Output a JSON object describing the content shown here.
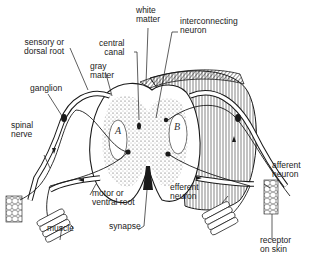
{
  "diagram": {
    "labels": {
      "white_matter": "white\nmatter",
      "interconnecting_neuron": "interconnecting\nneuron",
      "sensory_root": "sensory or\ndorsal root",
      "central_canal": "central\ncanal",
      "gray_matter": "gray\nmatter",
      "ganglion": "ganglion",
      "spinal_nerve": "spinal\nnerve",
      "motor_root": "motor or\nventral root",
      "muscle_left": "muscle",
      "synapse": "synapse",
      "efferent_neuron": "efferent\nneuron",
      "afferent_neuron": "afferent\nneuron",
      "receptor": "receptor\non skin",
      "region_a": "A",
      "region_b": "B"
    },
    "colors": {
      "ink": "#1a1a1a",
      "background": "#ffffff",
      "stipple": "#555555"
    }
  }
}
